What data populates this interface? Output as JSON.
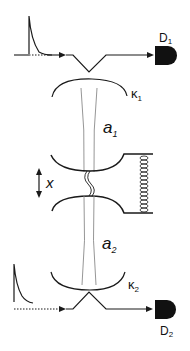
{
  "diagram": {
    "colors": {
      "stroke": "#1a1a1a",
      "beam": "#8a8a8a",
      "detector": "#111111",
      "background": "#ffffff"
    },
    "top_path": {
      "detector_label": "D",
      "detector_sub": "1",
      "coupling_label": "κ",
      "coupling_sub": "1"
    },
    "cavity_1": {
      "mode_label": "a",
      "mode_sub": "1"
    },
    "mechanics": {
      "displacement_label": "x",
      "spring_icon": "spring-icon",
      "arrow_icon": "double-arrow-icon"
    },
    "cavity_2": {
      "mode_label": "a",
      "mode_sub": "2"
    },
    "bottom_path": {
      "detector_label": "D",
      "detector_sub": "2",
      "coupling_label": "κ",
      "coupling_sub": "2"
    }
  }
}
